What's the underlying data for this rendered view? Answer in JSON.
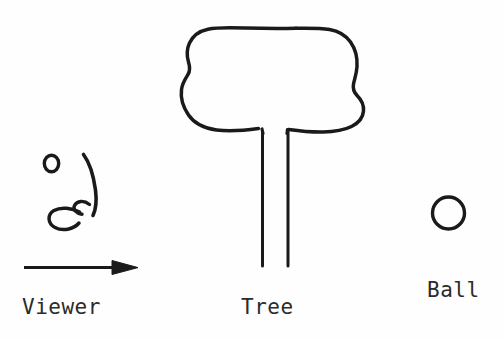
{
  "diagram": {
    "background_color": "#fefefe",
    "ink_color": "#1a1a1a",
    "style": "hand-drawn line sketch",
    "labels": {
      "viewer": "Viewer",
      "tree": "Tree",
      "ball": "Ball"
    },
    "objects": [
      {
        "name": "viewer",
        "label": "Viewer",
        "icon": "viewer-profile-face",
        "description": "hand drawn side profile face with eye circle, nose arc and mouth"
      },
      {
        "name": "direction-arrow",
        "label": "",
        "icon": "right-arrow",
        "description": "horizontal arrow pointing right indicating viewing direction"
      },
      {
        "name": "tree",
        "label": "Tree",
        "icon": "tree-sketch",
        "description": "rounded blob canopy on two vertical trunk lines"
      },
      {
        "name": "ball",
        "label": "Ball",
        "icon": "circle-outline",
        "description": "small open circle"
      }
    ]
  }
}
